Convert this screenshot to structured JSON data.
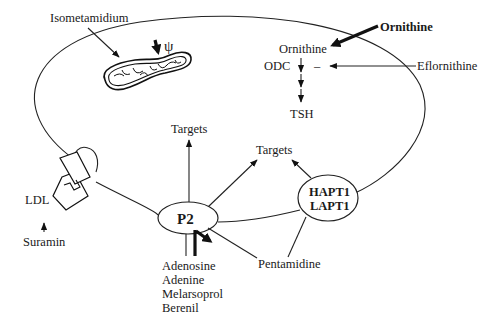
{
  "diagram": {
    "title": "",
    "cell": {
      "label": "cell-membrane"
    },
    "labels": {
      "isometamidium": "Isometamidium",
      "psi": "ψ",
      "ornithine_outside": "Ornithine",
      "ornithine_inside": "Ornithine",
      "odc": "ODC",
      "inhibit_sign": "–",
      "eflornithine": "Eflornithine",
      "tsh": "TSH",
      "targets_left": "Targets",
      "targets_right": "Targets",
      "p2": "P2",
      "hapt1": "HAPT1",
      "lapt1": "LAPT1",
      "ldl": "LDL",
      "suramin": "Suramin",
      "pentamidine": "Pentamidine",
      "p2_substrates": [
        "Adenosine",
        "Adenine",
        "Melarsoprol",
        "Berenil"
      ]
    },
    "nodes": [
      {
        "id": "mitochondrion",
        "type": "organelle"
      },
      {
        "id": "p2",
        "type": "transporter",
        "label": "P2"
      },
      {
        "id": "hapt1_lapt1",
        "type": "transporter",
        "label": "HAPT1 / LAPT1"
      },
      {
        "id": "ldl_receptor",
        "type": "receptor",
        "label": "LDL"
      }
    ],
    "edges": [
      {
        "from": "Isometamidium",
        "to": "mitochondrion"
      },
      {
        "from": "ψ",
        "to": "mitochondrion",
        "style": "thick"
      },
      {
        "from": "Ornithine (outside)",
        "to": "Ornithine (inside)",
        "style": "thick"
      },
      {
        "from": "Ornithine",
        "to": "TSH",
        "via": "ODC"
      },
      {
        "from": "Eflornithine",
        "to": "ODC",
        "effect": "inhibit (–)"
      },
      {
        "from": "P2",
        "to": "Targets"
      },
      {
        "from": "P2",
        "to": "Targets (right)"
      },
      {
        "from": "HAPT1/LAPT1",
        "to": "Targets (right)"
      },
      {
        "from": "Pentamidine",
        "to": "P2"
      },
      {
        "from": "Pentamidine",
        "to": "HAPT1/LAPT1"
      },
      {
        "from": "Suramin",
        "to": "LDL"
      },
      {
        "from": "Adenosine/Adenine/Melarsoprol/Berenil",
        "to": "P2"
      }
    ]
  }
}
